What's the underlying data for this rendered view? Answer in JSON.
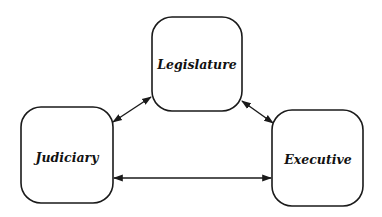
{
  "diagram": {
    "nodes": [
      {
        "id": "legislature",
        "label": "Legislature"
      },
      {
        "id": "judiciary",
        "label": "Judiciary"
      },
      {
        "id": "executive",
        "label": "Executive"
      }
    ],
    "edges": [
      {
        "from": "legislature",
        "to": "judiciary",
        "direction": "bidirectional"
      },
      {
        "from": "legislature",
        "to": "executive",
        "direction": "bidirectional"
      },
      {
        "from": "judiciary",
        "to": "executive",
        "direction": "bidirectional"
      }
    ],
    "colors": {
      "stroke": "#1a1a1a",
      "background": "#ffffff"
    }
  }
}
